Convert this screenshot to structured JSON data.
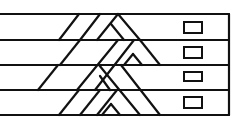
{
  "diagram": {
    "type": "braided-strips-with-handles",
    "stroke_color": "#111111",
    "background": "#ffffff",
    "frame": {
      "left": 0,
      "right": 229,
      "top": 14,
      "bottom": 115
    },
    "rows": [
      {
        "index": 1,
        "top": 14,
        "bottom": 40,
        "handle": {
          "x": 184,
          "y": 22,
          "w": 18,
          "h": 11
        }
      },
      {
        "index": 2,
        "top": 40,
        "bottom": 65,
        "handle": {
          "x": 184,
          "y": 47,
          "w": 18,
          "h": 11
        }
      },
      {
        "index": 3,
        "top": 65,
        "bottom": 90,
        "handle": {
          "x": 184,
          "y": 72,
          "w": 18,
          "h": 9
        }
      },
      {
        "index": 4,
        "top": 90,
        "bottom": 115,
        "handle": {
          "x": 184,
          "y": 97,
          "w": 18,
          "h": 11
        }
      }
    ],
    "braid_segments": [
      {
        "name": "r1-diag-a",
        "x1": 59,
        "y1": 40,
        "x2": 79,
        "y2": 14
      },
      {
        "name": "r1-diag-b",
        "x1": 80,
        "y1": 40,
        "x2": 100,
        "y2": 14
      },
      {
        "name": "r1-diag-c",
        "x1": 97,
        "y1": 40,
        "x2": 118,
        "y2": 14
      },
      {
        "name": "r1-back-a",
        "x1": 118,
        "y1": 14,
        "x2": 140,
        "y2": 40
      },
      {
        "name": "r1-back-b",
        "x1": 111,
        "y1": 24,
        "x2": 124,
        "y2": 40
      },
      {
        "name": "r2-diag-a",
        "x1": 60,
        "y1": 65,
        "x2": 80,
        "y2": 40
      },
      {
        "name": "r2-diag-long",
        "x1": 77,
        "y1": 90,
        "x2": 118,
        "y2": 40
      },
      {
        "name": "r2-diag-b",
        "x1": 95,
        "y1": 90,
        "x2": 134,
        "y2": 40
      },
      {
        "name": "r2-back-a",
        "x1": 140,
        "y1": 40,
        "x2": 160,
        "y2": 65
      },
      {
        "name": "r2-small-up",
        "x1": 124,
        "y1": 65,
        "x2": 133,
        "y2": 54
      },
      {
        "name": "r2-small-down",
        "x1": 133,
        "y1": 54,
        "x2": 142,
        "y2": 65
      },
      {
        "name": "r3-back-a",
        "x1": 99,
        "y1": 65,
        "x2": 140,
        "y2": 115
      },
      {
        "name": "r3-back-b",
        "x1": 100,
        "y1": 76,
        "x2": 110,
        "y2": 90
      },
      {
        "name": "r3-back-c",
        "x1": 121,
        "y1": 65,
        "x2": 160,
        "y2": 115
      },
      {
        "name": "r4-diag-a",
        "x1": 59,
        "y1": 115,
        "x2": 79,
        "y2": 90
      },
      {
        "name": "r4-diag-b",
        "x1": 80,
        "y1": 115,
        "x2": 100,
        "y2": 90
      },
      {
        "name": "r4-diag-c",
        "x1": 97,
        "y1": 115,
        "x2": 117,
        "y2": 90
      },
      {
        "name": "r4-small-up",
        "x1": 102,
        "y1": 115,
        "x2": 111,
        "y2": 104
      },
      {
        "name": "r4-small-down",
        "x1": 111,
        "y1": 104,
        "x2": 120,
        "y2": 115
      },
      {
        "name": "r3-left-diag",
        "x1": 38,
        "y1": 90,
        "x2": 58,
        "y2": 65
      }
    ]
  }
}
